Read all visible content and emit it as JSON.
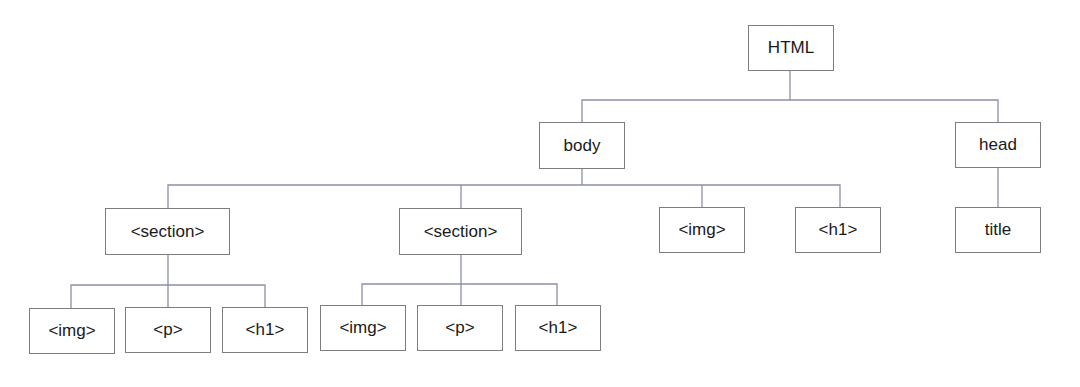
{
  "diagram": {
    "type": "tree",
    "title": "",
    "colors": {
      "edge": "#8a90a8",
      "node_border": "#7d7d80",
      "node_text": "#1a1a1a",
      "background": "#ffffff"
    },
    "nodes": [
      {
        "id": "html",
        "label": "HTML",
        "x": 748,
        "y": 25,
        "w": 86,
        "h": 46
      },
      {
        "id": "body",
        "label": "body",
        "x": 539,
        "y": 122,
        "w": 86,
        "h": 47
      },
      {
        "id": "head",
        "label": "head",
        "x": 955,
        "y": 122,
        "w": 86,
        "h": 46
      },
      {
        "id": "section1",
        "label": "<section>",
        "x": 105,
        "y": 208,
        "w": 125,
        "h": 47
      },
      {
        "id": "section2",
        "label": "<section>",
        "x": 399,
        "y": 208,
        "w": 123,
        "h": 47
      },
      {
        "id": "img_top",
        "label": "<img>",
        "x": 659,
        "y": 207,
        "w": 86,
        "h": 46
      },
      {
        "id": "h1_top",
        "label": "<h1>",
        "x": 795,
        "y": 207,
        "w": 86,
        "h": 46
      },
      {
        "id": "title",
        "label": "title",
        "x": 955,
        "y": 207,
        "w": 86,
        "h": 46
      },
      {
        "id": "s1_img",
        "label": "<img>",
        "x": 29,
        "y": 308,
        "w": 86,
        "h": 46
      },
      {
        "id": "s1_p",
        "label": "<p>",
        "x": 125,
        "y": 307,
        "w": 86,
        "h": 46
      },
      {
        "id": "s1_h1",
        "label": "<h1>",
        "x": 222,
        "y": 307,
        "w": 86,
        "h": 46
      },
      {
        "id": "s2_img",
        "label": "<img>",
        "x": 320,
        "y": 305,
        "w": 86,
        "h": 46
      },
      {
        "id": "s2_p",
        "label": "<p>",
        "x": 417,
        "y": 305,
        "w": 86,
        "h": 46
      },
      {
        "id": "s2_h1",
        "label": "<h1>",
        "x": 515,
        "y": 305,
        "w": 86,
        "h": 46
      }
    ],
    "edges": [
      {
        "from": "html",
        "to": "body"
      },
      {
        "from": "html",
        "to": "head"
      },
      {
        "from": "body",
        "to": "section1"
      },
      {
        "from": "body",
        "to": "section2"
      },
      {
        "from": "body",
        "to": "img_top"
      },
      {
        "from": "body",
        "to": "h1_top"
      },
      {
        "from": "head",
        "to": "title"
      },
      {
        "from": "section1",
        "to": "s1_img"
      },
      {
        "from": "section1",
        "to": "s1_p"
      },
      {
        "from": "section1",
        "to": "s1_h1"
      },
      {
        "from": "section2",
        "to": "s2_img"
      },
      {
        "from": "section2",
        "to": "s2_p"
      },
      {
        "from": "section2",
        "to": "s2_h1"
      }
    ],
    "connector_lines": [
      {
        "points": [
          [
            790,
            71
          ],
          [
            790,
            100
          ]
        ]
      },
      {
        "points": [
          [
            582,
            122
          ],
          [
            582,
            100
          ],
          [
            998,
            100
          ],
          [
            998,
            122
          ]
        ]
      },
      {
        "points": [
          [
            582,
            169
          ],
          [
            582,
            185
          ]
        ]
      },
      {
        "points": [
          [
            168,
            208
          ],
          [
            168,
            185
          ],
          [
            840,
            185
          ],
          [
            840,
            207
          ]
        ]
      },
      {
        "points": [
          [
            461,
            185
          ],
          [
            461,
            208
          ]
        ]
      },
      {
        "points": [
          [
            702,
            185
          ],
          [
            702,
            207
          ]
        ]
      },
      {
        "points": [
          [
            998,
            168
          ],
          [
            998,
            207
          ]
        ]
      },
      {
        "points": [
          [
            168,
            255
          ],
          [
            168,
            285
          ]
        ]
      },
      {
        "points": [
          [
            71,
            308
          ],
          [
            71,
            285
          ],
          [
            265,
            285
          ],
          [
            265,
            307
          ]
        ]
      },
      {
        "points": [
          [
            168,
            285
          ],
          [
            168,
            307
          ]
        ]
      },
      {
        "points": [
          [
            461,
            255
          ],
          [
            461,
            284
          ]
        ]
      },
      {
        "points": [
          [
            362,
            305
          ],
          [
            362,
            284
          ],
          [
            557,
            284
          ],
          [
            557,
            305
          ]
        ]
      },
      {
        "points": [
          [
            461,
            284
          ],
          [
            461,
            305
          ]
        ]
      }
    ]
  }
}
